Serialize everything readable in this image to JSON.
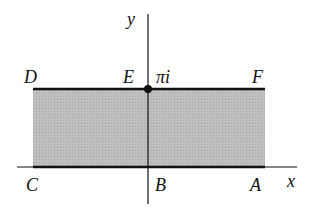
{
  "diagram": {
    "axes": {
      "x_label": "x",
      "y_label": "y"
    },
    "points": {
      "A": "A",
      "B": "B",
      "C": "C",
      "D": "D",
      "E": "E",
      "F": "F"
    },
    "marked_value": "πi",
    "colors": {
      "fill": "#b8b8b8",
      "stroke": "#111111",
      "background": "#ffffff"
    }
  }
}
